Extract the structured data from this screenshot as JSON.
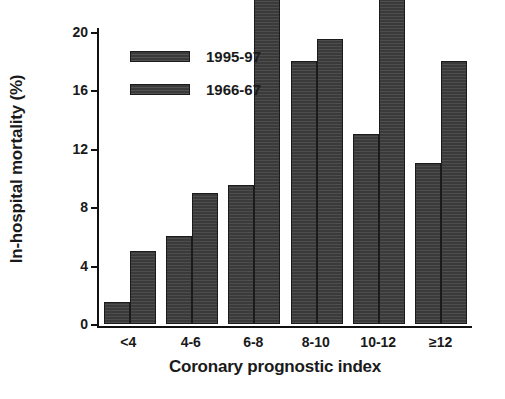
{
  "chart_data": {
    "type": "bar",
    "title": "",
    "xlabel": "Coronary prognostic index",
    "ylabel": "In-hospital mortality (%)",
    "categories": [
      "<4",
      "4-6",
      "6-8",
      "8-10",
      "10-12",
      "≥12"
    ],
    "series": [
      {
        "name": "1995-97",
        "values": [
          1.5,
          6,
          9.5,
          18,
          13,
          11
        ]
      },
      {
        "name": "1966-67",
        "values": [
          5,
          9,
          22.5,
          19.5,
          26.5,
          18
        ]
      }
    ],
    "ylim": [
      0,
      20
    ],
    "yticks": [
      0,
      4,
      8,
      12,
      16,
      20
    ],
    "ytick_labels": [
      "0",
      "4",
      "8",
      "12",
      "16",
      "20"
    ],
    "grid": false,
    "legend_position": "top-left",
    "bar_color": "#3a3a3a",
    "axis_color": "#111111",
    "background": "#ffffff"
  },
  "legend": {
    "entries": [
      {
        "label": "1995-97"
      },
      {
        "label": "1966-67"
      }
    ]
  }
}
